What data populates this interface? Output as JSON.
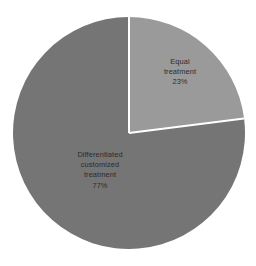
{
  "chart_data": {
    "type": "pie",
    "title": "",
    "subtitle": "",
    "xlabel": "",
    "ylabel": "",
    "grid": false,
    "legend": "none",
    "start_angle_deg": 0,
    "direction": "clockwise",
    "categories": [
      "Equal treatment",
      "Differentiated customized treatment"
    ],
    "values": [
      23,
      77
    ],
    "value_unit": "%",
    "slices": [
      {
        "name": "Equal treatment",
        "value": 23,
        "percent_label": "23%",
        "color": "#9a9a9a",
        "label_lines": [
          "Equal",
          "treatment",
          "23%"
        ],
        "start_angle_deg": 0,
        "end_angle_deg": 82.8
      },
      {
        "name": "Differentiated customized treatment",
        "value": 77,
        "percent_label": "77%",
        "color": "#757575",
        "label_lines": [
          "Differentiated",
          "customized",
          "treatment",
          "77%"
        ],
        "start_angle_deg": 82.8,
        "end_angle_deg": 360
      }
    ]
  },
  "figure": {
    "background_color": "#ffffff",
    "divider_color": "#ffffff",
    "label_text_color": "#2b2b2b",
    "center_x": 129,
    "center_y": 133,
    "radius": 116
  },
  "labels": {
    "equal": {
      "line1": "Equal",
      "line2": "treatment",
      "line3": "23%"
    },
    "differentiated": {
      "line1": "Differentiated",
      "line2": "customized",
      "line3": "treatment",
      "line4": "77%"
    }
  }
}
